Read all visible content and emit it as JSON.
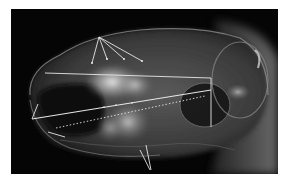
{
  "image": {
    "subject": "Lateral X-ray radiograph of a skull with measurement annotations",
    "background_color": "#ffffff",
    "frame_color": "#050505"
  },
  "annotations": {
    "line_color": "#e8e8e8",
    "fan_lines": {
      "origin": [
        99,
        37
      ],
      "endpoints": [
        [
          92,
          63
        ],
        [
          107,
          59
        ],
        [
          124,
          59
        ],
        [
          142,
          61
        ]
      ]
    },
    "rectangle_top_line": [
      [
        45,
        73
      ],
      [
        211,
        78
      ]
    ],
    "vertical_line": [
      [
        211,
        78
      ],
      [
        211,
        127
      ]
    ],
    "slanted_line": [
      [
        32,
        119
      ],
      [
        211,
        90
      ]
    ],
    "short_left_line": [
      [
        32,
        119
      ],
      [
        38,
        104
      ]
    ],
    "dotted_line": [
      [
        56,
        128
      ],
      [
        205,
        96
      ]
    ],
    "short_bottom_line": [
      [
        48,
        132
      ],
      [
        65,
        137
      ]
    ],
    "bottom_v_lines": [
      [
        [
          140,
          150
        ],
        [
          150,
          170
        ]
      ],
      [
        [
          146,
          145
        ],
        [
          151,
          170
        ]
      ]
    ]
  }
}
